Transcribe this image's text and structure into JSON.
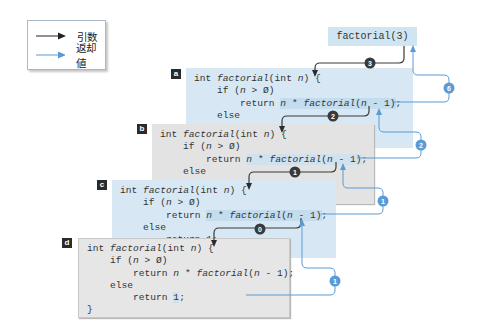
{
  "legend": {
    "items": [
      {
        "label": "引数",
        "color": "#222222",
        "meaning": "argument"
      },
      {
        "label": "返却値",
        "color": "#5b9bd5",
        "meaning": "return value"
      }
    ]
  },
  "top_call": "factorial(3)",
  "frames": [
    {
      "tag": "a",
      "lines": [
        "int factorial(int n) {",
        "    if (n > 0)",
        "        return n * factorial(n - 1);",
        "    else",
        "        return 1;"
      ]
    },
    {
      "tag": "b",
      "lines": [
        "int factorial(int n) {",
        "    if (n > 0)",
        "        return n * factorial(n - 1);",
        "    else",
        "        return 1;"
      ]
    },
    {
      "tag": "c",
      "lines": [
        "int factorial(int n) {",
        "    if (n > 0)",
        "        return n * factorial(n - 1);",
        "    else",
        "        return 1;"
      ]
    },
    {
      "tag": "d",
      "lines": [
        "int factorial(int n) {",
        "    if (n > 0)",
        "        return n * factorial(n - 1);",
        "    else",
        "        return 1;",
        "}"
      ]
    }
  ],
  "argument_badges": [
    "3",
    "2",
    "1",
    "0"
  ],
  "return_badges": [
    "6",
    "2",
    "1",
    "1"
  ],
  "colors": {
    "blue_frame": "#d7e8f4",
    "gray_frame": "#e3e3e3",
    "arrow_dark": "#333333",
    "arrow_blue": "#5b9bd5",
    "badge_dark": "#3a3a3a",
    "badge_blue": "#5b9bd5"
  }
}
